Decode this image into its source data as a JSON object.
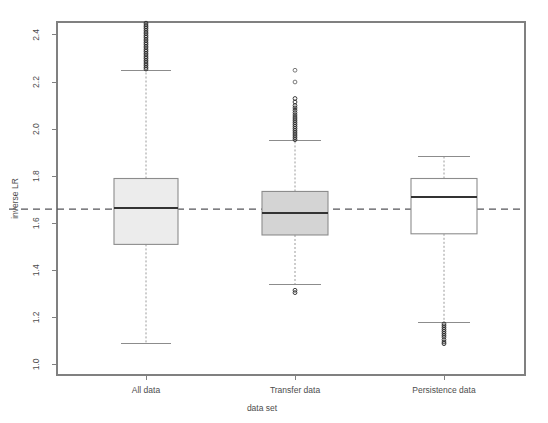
{
  "chart_data": {
    "type": "box",
    "title": "",
    "xlabel": "data set",
    "ylabel": "inverse LR",
    "categories": [
      "All data",
      "Transfer data",
      "Persistence data"
    ],
    "ylim": [
      0.955,
      2.455
    ],
    "yticks": [
      1.0,
      1.2,
      1.4,
      1.6,
      1.8,
      2.0,
      2.2,
      2.4
    ],
    "ytick_labels": [
      "1.0",
      "1.2",
      "1.4",
      "1.6",
      "1.8",
      "2.0",
      "2.2",
      "2.4"
    ],
    "grid": false,
    "legend": "none",
    "reference_line": {
      "value": 1.66,
      "orientation": "horizontal",
      "style": "dashed",
      "color": "#55555a"
    },
    "boxes": [
      {
        "name": "All data",
        "fill": "#ececec",
        "lower_whisker": 1.09,
        "q1": 1.51,
        "median": 1.665,
        "q3": 1.79,
        "upper_whisker": 2.25,
        "outliers_high": [
          2.255,
          2.262,
          2.27,
          2.277,
          2.285,
          2.292,
          2.3,
          2.307,
          2.315,
          2.322,
          2.33,
          2.337,
          2.345,
          2.352,
          2.36,
          2.367,
          2.375,
          2.382,
          2.39,
          2.397,
          2.405,
          2.412,
          2.42,
          2.428,
          2.435,
          2.442,
          2.45
        ],
        "outliers_low": []
      },
      {
        "name": "Transfer data",
        "fill": "#d4d4d4",
        "lower_whisker": 1.34,
        "q1": 1.55,
        "median": 1.645,
        "q3": 1.735,
        "upper_whisker": 1.95,
        "outliers_high": [
          1.955,
          1.963,
          1.971,
          1.979,
          1.987,
          1.995,
          2.003,
          2.011,
          2.019,
          2.027,
          2.035,
          2.043,
          2.051,
          2.06,
          2.07,
          2.08,
          2.09,
          2.1,
          2.115,
          2.13,
          2.2,
          2.25
        ],
        "outliers_low": [
          1.315,
          1.305
        ]
      },
      {
        "name": "Persistence data",
        "fill": "#ffffff",
        "lower_whisker": 1.18,
        "q1": 1.555,
        "median": 1.71,
        "q3": 1.79,
        "upper_whisker": 1.885,
        "outliers_high": [],
        "outliers_low": [
          1.172,
          1.164,
          1.156,
          1.148,
          1.14,
          1.132,
          1.124,
          1.116,
          1.105,
          1.095,
          1.088
        ]
      }
    ]
  }
}
